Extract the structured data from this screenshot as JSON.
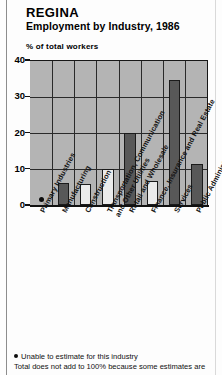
{
  "header": {
    "title": "REGINA",
    "subtitle": "Employment by Industry, 1986"
  },
  "axis_caption": "% of total workers",
  "footnotes": {
    "marker_icon": "bullet-dot-icon",
    "line1": "Unable to estimate for this industry",
    "line2": "Total does not add to 100% because some estimates are"
  },
  "chart_data": {
    "type": "bar",
    "title": "REGINA",
    "subtitle": "Employment by Industry, 1986",
    "xlabel": "",
    "ylabel": "% of total workers",
    "ylim": [
      0,
      40
    ],
    "yticks": [
      0,
      10,
      20,
      30,
      40
    ],
    "ytick_labels": [
      "0",
      "10",
      "20",
      "30",
      "40"
    ],
    "grid": true,
    "grid_axis": "both",
    "legend": "none",
    "plot_background": "#b4b4b4",
    "bar_colors": {
      "dark": "#585858",
      "light": "#ebebeb"
    },
    "categories": [
      "Primary Industries",
      "Manufacturing",
      "Construction",
      "Transportation, Communication and Other Utilities",
      "Retail and Wholesale",
      "Finance, Insurance and Real Estate",
      "Services",
      "Public Administration"
    ],
    "category_lines": [
      [
        "Primary Industries"
      ],
      [
        "Manufacturing"
      ],
      [
        "Construction"
      ],
      [
        "Transportation, Communication",
        "and Other Utilities"
      ],
      [
        "Retail and Wholesale"
      ],
      [
        "Finance, Insurance and Real Estate"
      ],
      [
        "Services"
      ],
      [
        "Public Administration"
      ]
    ],
    "values": [
      null,
      6.0,
      5.9,
      9.8,
      19.8,
      6.5,
      34.5,
      11.3
    ],
    "value_labels": [
      "*",
      "6.0",
      "5.9",
      "9.8",
      "19.8",
      "6.5",
      "34.5",
      "11.3"
    ],
    "shades": [
      "none",
      "dark",
      "light",
      "light",
      "dark",
      "light",
      "dark",
      "dark"
    ],
    "annotations": [
      {
        "category": "Primary Industries",
        "marker": "dot",
        "note": "Unable to estimate for this industry"
      }
    ]
  }
}
